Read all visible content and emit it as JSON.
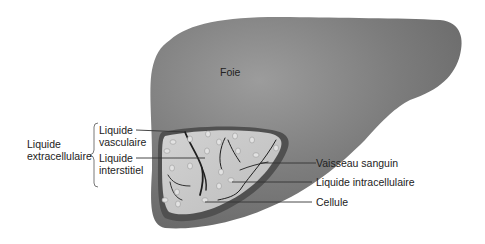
{
  "diagram": {
    "organ_label": "Foie",
    "group_label": {
      "line1": "Liquide",
      "line2": "extracellulaire"
    },
    "left_labels": [
      {
        "line1": "Liquide",
        "line2": "vasculaire"
      },
      {
        "line1": "Liquide",
        "line2": "interstitiel"
      }
    ],
    "right_labels": [
      "Vaisseau sanguin",
      "Liquide intracellulaire",
      "Cellule"
    ],
    "colors": {
      "liver": "#7a7a7a",
      "liver_highlight": "#9a9a9a",
      "liver_dark": "#555555",
      "cutaway": "#c8c8c8",
      "vessel": "#1e1e1e",
      "cell": "#e0e0e0",
      "text": "#222222"
    }
  }
}
